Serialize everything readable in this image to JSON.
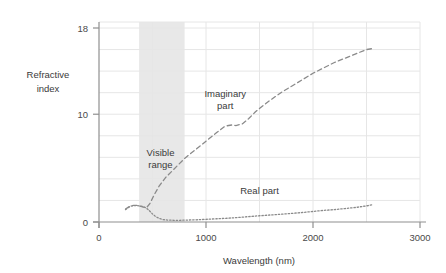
{
  "chart_data": {
    "type": "line",
    "title": "",
    "xlabel": "Wavelength (nm)",
    "ylabel": "Refractive index",
    "ylabel_line1": "Refractive",
    "ylabel_line2": "index",
    "xlim": [
      0,
      3000
    ],
    "ylim": [
      0,
      18
    ],
    "xticks": [
      0,
      1000,
      2000,
      3000
    ],
    "xtick_labels": [
      "0",
      "1000",
      "2000",
      "3000"
    ],
    "yticks": [
      0,
      10,
      18
    ],
    "ytick_labels": [
      "0",
      "10",
      "18"
    ],
    "grid": true,
    "grid_x_step": 500,
    "grid_y_step": 2,
    "legend": "none",
    "annotations": [
      {
        "name": "imaginary-part-label",
        "text_line1": "Imaginary",
        "text_line2": "part",
        "x": 1180,
        "y": 11.6
      },
      {
        "name": "real-part-label",
        "text_line1": "Real part",
        "text_line2": "",
        "x": 1500,
        "y": 2.6
      },
      {
        "name": "visible-range-label",
        "text_line1": "Visible",
        "text_line2": "range",
        "x": 575,
        "y": 6.1
      }
    ],
    "shaded_regions": [
      {
        "name": "visible-range",
        "label": "Visible range",
        "x_start": 375,
        "x_end": 800,
        "color": "#e8e8e8"
      }
    ],
    "series": [
      {
        "name": "Real part",
        "style": "dotted",
        "color": "#8a8a8a",
        "x": [
          248,
          275,
          300,
          325,
          350,
          375,
          400,
          420,
          440,
          460,
          480,
          500,
          520,
          540,
          560,
          580,
          600,
          640,
          700,
          760,
          820,
          900,
          1000,
          1100,
          1200,
          1300,
          1400,
          1500,
          1600,
          1700,
          1800,
          1900,
          2000,
          2100,
          2200,
          2300,
          2400,
          2500,
          2560
        ],
        "y": [
          1.15,
          1.35,
          1.48,
          1.52,
          1.52,
          1.5,
          1.45,
          1.4,
          1.3,
          1.15,
          0.95,
          0.75,
          0.58,
          0.45,
          0.35,
          0.28,
          0.22,
          0.18,
          0.16,
          0.16,
          0.18,
          0.2,
          0.25,
          0.3,
          0.35,
          0.42,
          0.5,
          0.58,
          0.65,
          0.72,
          0.8,
          0.88,
          0.98,
          1.08,
          1.15,
          1.25,
          1.35,
          1.5,
          1.6
        ]
      },
      {
        "name": "Imaginary part",
        "style": "dashed",
        "color": "#8a8a8a",
        "x": [
          248,
          275,
          300,
          325,
          350,
          375,
          400,
          425,
          450,
          475,
          500,
          520,
          560,
          620,
          700,
          800,
          900,
          1000,
          1100,
          1180,
          1240,
          1280,
          1340,
          1400,
          1460,
          1520,
          1600,
          1700,
          1800,
          1900,
          2000,
          2100,
          2200,
          2300,
          2400,
          2500,
          2560
        ],
        "y": [
          1.2,
          1.38,
          1.5,
          1.55,
          1.55,
          1.5,
          1.42,
          1.35,
          1.4,
          1.7,
          2.2,
          2.6,
          3.3,
          4.1,
          4.9,
          5.9,
          6.7,
          7.5,
          8.3,
          8.9,
          9.0,
          8.95,
          9.1,
          9.6,
          10.2,
          10.7,
          11.3,
          12.0,
          12.6,
          13.2,
          13.8,
          14.3,
          14.8,
          15.2,
          15.6,
          16.0,
          16.1
        ]
      }
    ]
  },
  "style": {
    "axis_color": "#9a9a9a",
    "grid_color": "#e6e6e6",
    "text_color": "#3a3a3a",
    "background": "#ffffff",
    "shade_color": "#e9e9e9"
  }
}
